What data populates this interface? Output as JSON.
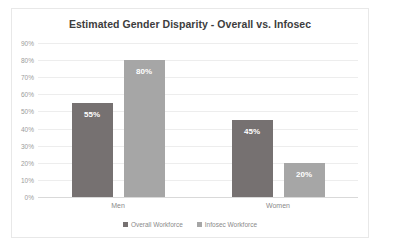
{
  "chart_data": {
    "type": "bar",
    "title": "Estimated Gender Disparity - Overall vs. Infosec",
    "xlabel": "",
    "ylabel": "",
    "categories": [
      "Men",
      "Women"
    ],
    "series": [
      {
        "name": "Overall Workforce",
        "color": "#767171",
        "values": [
          55,
          45
        ],
        "labels": [
          "55%",
          "20%"
        ]
      },
      {
        "name": "Infosec Workforce",
        "color": "#a6a6a6",
        "values": [
          80,
          20
        ],
        "labels": [
          "80%",
          "20%"
        ]
      }
    ],
    "points": [
      {
        "category": "Men",
        "series": "Overall Workforce",
        "value": 55,
        "label": "55%"
      },
      {
        "category": "Men",
        "series": "Infosec Workforce",
        "value": 80,
        "label": "80%"
      },
      {
        "category": "Women",
        "series": "Overall Workforce",
        "value": 45,
        "label": "45%"
      },
      {
        "category": "Women",
        "series": "Infosec Workforce",
        "value": 20,
        "label": "20%"
      }
    ],
    "ylim": [
      0,
      90
    ],
    "ytick_step": 10,
    "yticks": [
      "0%",
      "10%",
      "20%",
      "30%",
      "40%",
      "50%",
      "60%",
      "70%",
      "80%",
      "90%"
    ],
    "grid": true,
    "legend_position": "bottom",
    "value_labels_inside_bars": true,
    "title_color": "#3d3d3d",
    "gridline_color": "#ededed",
    "axis_text_color": "#9b9b9b"
  }
}
